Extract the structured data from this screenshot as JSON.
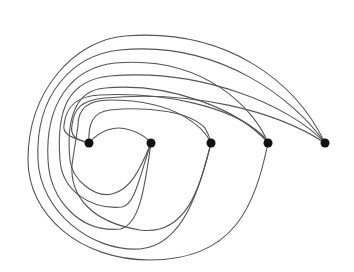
{
  "diagram": {
    "type": "graph",
    "colors": {
      "edge": "#555555",
      "node": "#111111",
      "background": "#ffffff"
    },
    "nodes": [
      {
        "id": "v1",
        "x": 89,
        "y": 143
      },
      {
        "id": "v2",
        "x": 151,
        "y": 143
      },
      {
        "id": "v3",
        "x": 211,
        "y": 143
      },
      {
        "id": "v4",
        "x": 268,
        "y": 143
      },
      {
        "id": "v5",
        "x": 325,
        "y": 143
      }
    ],
    "edges": [
      {
        "from": "v1",
        "to": "v2",
        "d": "M89,143 C100,130 115,125 130,130 C140,133 147,138 151,143"
      },
      {
        "from": "v1",
        "to": "v3",
        "d": "M89,143 C88,125 92,112 110,110 C150,106 190,112 205,128 C208,133 210,138 211,143"
      },
      {
        "from": "v1",
        "to": "v4",
        "d": "M89,143 C75,138 62,136 64,125 C66,105 78,96 100,95 C160,92 230,105 262,135 C265,138 267,140 268,143"
      },
      {
        "from": "v3",
        "to": "v4",
        "d": "M211,143 C205,130 180,100 110,100 C85,100 78,112 78,125 C76,140 74,150 72,165 C70,195 90,222 140,230 C185,236 200,190 211,143"
      },
      {
        "from": "v2",
        "to": "v4",
        "d": "M151,143 C140,170 130,190 112,194 C95,198 72,180 70,160 C66,120 75,90 105,88 C170,82 240,110 268,143"
      },
      {
        "from": "v2",
        "to": "v5",
        "d": "M151,143 C140,175 135,205 122,207 C90,210 62,190 60,160 C56,110 68,80 110,76 C200,68 290,105 325,143"
      },
      {
        "from": "v2",
        "to": "v4b",
        "d": "M151,143 C145,185 140,225 120,229 C80,233 50,200 48,160 C45,105 70,68 115,63 C205,55 255,110 268,143"
      },
      {
        "from": "v3",
        "to": "v5",
        "d": "M211,143 C200,185 185,245 140,249 C90,252 40,210 38,160 C35,95 72,55 120,50 C220,40 295,100 325,143"
      },
      {
        "from": "v4",
        "to": "v5",
        "d": "M268,143 C255,205 235,260 150,260 C80,260 28,215 28,160 C28,90 75,40 125,36 C225,28 295,80 325,143"
      },
      {
        "from": "v1",
        "to": "v5",
        "d": "M89,143 C75,140 70,135 72,125 C74,108 82,100 105,98 C190,90 275,110 325,143"
      }
    ]
  }
}
